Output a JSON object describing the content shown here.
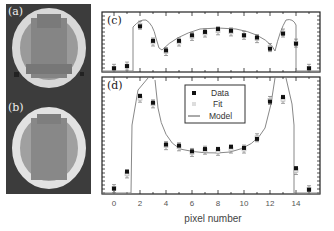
{
  "figure": {
    "panels": {
      "a": {
        "label": "(a)"
      },
      "b": {
        "label": "(b)"
      },
      "c": {
        "label": "(c)"
      },
      "d": {
        "label": "(d)"
      }
    },
    "legend": {
      "items": [
        {
          "label": "Data",
          "marker": "filled-square",
          "color": "#111111"
        },
        {
          "label": "Fit",
          "marker": "open-square",
          "color": "#cccccc"
        },
        {
          "label": "Model",
          "marker": "line",
          "color": "#666666"
        }
      ]
    },
    "xaxis": {
      "label": "pixel number",
      "ticks": [
        "0",
        "2",
        "4",
        "6",
        "8",
        "10",
        "12",
        "14"
      ]
    }
  },
  "chart_data": [
    {
      "type": "scatter",
      "title": "(c)",
      "xlabel": "pixel number",
      "ylabel": "",
      "xlim": [
        -1,
        16
      ],
      "x": [
        0,
        1,
        2,
        3,
        4,
        5,
        6,
        7,
        8,
        9,
        10,
        11,
        12,
        13,
        14,
        15
      ],
      "series": [
        {
          "name": "Data",
          "values": [
            0.03,
            0.07,
            0.78,
            0.52,
            0.35,
            0.52,
            0.62,
            0.68,
            0.73,
            0.7,
            0.62,
            0.58,
            0.38,
            0.65,
            0.47,
            0.03
          ]
        },
        {
          "name": "Fit",
          "values": [
            0.03,
            0.07,
            0.8,
            0.5,
            0.33,
            0.5,
            0.6,
            0.66,
            0.7,
            0.68,
            0.62,
            0.56,
            0.4,
            0.66,
            0.48,
            0.03
          ]
        }
      ],
      "grid": false,
      "legend_position": "none"
    },
    {
      "type": "scatter",
      "title": "(d)",
      "xlabel": "pixel number",
      "ylabel": "",
      "xlim": [
        -1,
        16
      ],
      "x": [
        0,
        1,
        2,
        3,
        4,
        5,
        6,
        7,
        8,
        9,
        10,
        11,
        12,
        13,
        14,
        15
      ],
      "series": [
        {
          "name": "Data",
          "values": [
            0.03,
            0.18,
            0.85,
            0.79,
            0.42,
            0.41,
            0.36,
            0.38,
            0.38,
            0.4,
            0.39,
            0.47,
            0.8,
            0.84,
            0.21,
            0.02
          ]
        },
        {
          "name": "Fit",
          "values": [
            0.03,
            0.16,
            0.83,
            0.78,
            0.41,
            0.4,
            0.35,
            0.37,
            0.36,
            0.38,
            0.38,
            0.48,
            0.81,
            0.82,
            0.19,
            0.02
          ]
        }
      ],
      "grid": false,
      "legend_position": "upper center",
      "xticks": [
        0,
        2,
        4,
        6,
        8,
        10,
        12,
        14
      ]
    }
  ]
}
